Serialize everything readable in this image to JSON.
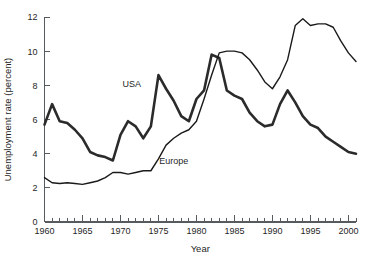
{
  "chart_data": {
    "type": "line",
    "title": "",
    "xlabel": "Year",
    "ylabel": "Unemployment rate (percent)",
    "xlim": [
      1960,
      2001
    ],
    "ylim": [
      0,
      12
    ],
    "ytick_values": [
      0,
      2,
      4,
      6,
      8,
      10,
      12
    ],
    "ytick_labels": [
      "0",
      "2",
      "4",
      "6",
      "8",
      "10",
      "12"
    ],
    "xtick_labels": [
      "1960",
      "1965",
      "1970",
      "1975",
      "1980",
      "1985",
      "1990",
      "1995",
      "2000"
    ],
    "xtick_label_values": [
      1960,
      1965,
      1970,
      1975,
      1980,
      1985,
      1990,
      1995,
      2000
    ],
    "xtick_minor_step": 1,
    "grid": false,
    "legend_position": "inline-annotations",
    "x": [
      1960,
      1961,
      1962,
      1963,
      1964,
      1965,
      1966,
      1967,
      1968,
      1969,
      1970,
      1971,
      1972,
      1973,
      1974,
      1975,
      1976,
      1977,
      1978,
      1979,
      1980,
      1981,
      1982,
      1983,
      1984,
      1985,
      1986,
      1987,
      1988,
      1989,
      1990,
      1991,
      1992,
      1993,
      1994,
      1995,
      1996,
      1997,
      1998,
      1999,
      2000,
      2001
    ],
    "series": [
      {
        "name": "USA",
        "color": "#2b2b2b",
        "stroke_width": 2.6,
        "label_x": 1971.5,
        "label_y": 7.9,
        "values": [
          5.7,
          6.9,
          5.9,
          5.8,
          5.4,
          4.9,
          4.1,
          3.9,
          3.8,
          3.6,
          5.1,
          5.9,
          5.6,
          4.9,
          5.6,
          8.6,
          7.8,
          7.1,
          6.2,
          5.9,
          7.2,
          7.7,
          9.8,
          9.6,
          7.7,
          7.4,
          7.2,
          6.4,
          5.9,
          5.6,
          5.7,
          6.9,
          7.7,
          7.0,
          6.2,
          5.7,
          5.5,
          5.0,
          4.7,
          4.4,
          4.1,
          4.0
        ]
      },
      {
        "name": "Europe",
        "color": "#1a1a1a",
        "stroke_width": 1.4,
        "label_x": 1977.0,
        "label_y": 3.4,
        "values": [
          2.6,
          2.3,
          2.25,
          2.3,
          2.25,
          2.2,
          2.3,
          2.4,
          2.6,
          2.9,
          2.9,
          2.8,
          2.9,
          3.0,
          3.0,
          3.7,
          4.5,
          4.9,
          5.2,
          5.4,
          5.9,
          7.2,
          8.6,
          9.9,
          10.0,
          10.0,
          9.9,
          9.5,
          8.9,
          8.2,
          7.8,
          8.5,
          9.5,
          11.5,
          11.9,
          11.5,
          11.6,
          11.6,
          11.4,
          10.6,
          9.9,
          9.4
        ]
      }
    ]
  },
  "axis": {
    "y_title": "Unemployment rate (percent)",
    "x_title": "Year"
  }
}
